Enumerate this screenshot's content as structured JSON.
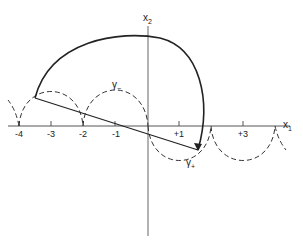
{
  "diagram": {
    "axes": {
      "x_label": "x",
      "x_label_sub": "1",
      "y_label": "x",
      "y_label_sub": "2",
      "ticks": [
        {
          "value": -4,
          "label": "-4"
        },
        {
          "value": -3,
          "label": "-3"
        },
        {
          "value": -2,
          "label": "-2"
        },
        {
          "value": -1,
          "label": "-1"
        },
        {
          "value": 1,
          "label": "+1"
        },
        {
          "value": 3,
          "label": "+3"
        }
      ]
    },
    "curves": {
      "gamma_minus_label": "γ",
      "gamma_minus_sub": "−",
      "gamma_plus_label": "γ",
      "gamma_plus_sub": "+"
    },
    "colors": {
      "stroke": "#222222",
      "axis": "#555555",
      "background": "#ffffff"
    }
  }
}
